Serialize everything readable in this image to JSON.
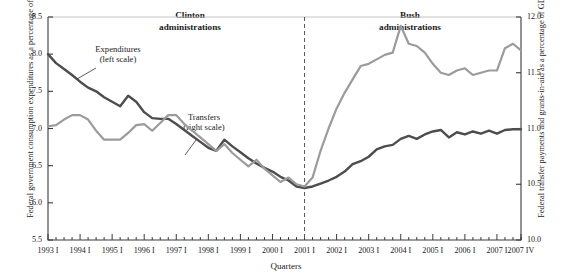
{
  "axes": {
    "ylabel_left": "Federal government consumption expenditures as a percentage of GDP",
    "ylabel_right": "Federal transfer payments and grants-in-aid as a percentage of GDP",
    "xlabel": "Quarters",
    "yticks_left": [
      "5.5",
      "6.0",
      "6.5",
      "7.0",
      "7.5",
      "8.0",
      "8.5"
    ],
    "yticks_right": [
      "10.0",
      "10.5",
      "11.0",
      "11.5",
      "12.0"
    ],
    "xticks": [
      "1993 I",
      "1994 I",
      "1995 I",
      "1996 I",
      "1997 I",
      "1998 I",
      "1999 I",
      "2000 I",
      "2001 I",
      "2002 I",
      "2003 I",
      "2004 I",
      "2005 I",
      "2006 I",
      "2007 I",
      "2007 IV"
    ]
  },
  "annotations": {
    "era_clinton": "Clinton\nadministrations",
    "era_clinton_line1": "Clinton",
    "era_clinton_line2": "administrations",
    "era_bush_line1": "Bush",
    "era_bush_line2": "administrations",
    "callout_expenditures_line1": "Expenditures",
    "callout_expenditures_line2": "(left scale)",
    "callout_transfers_line1": "Transfers",
    "callout_transfers_line2": "(right scale)",
    "divider_label": "2001 I"
  },
  "colors": {
    "expenditures": "#4d4d4d",
    "transfers": "#9b9b9b",
    "axis": "#3a3a3a",
    "background": "#ffffff"
  },
  "chart_data": {
    "type": "line",
    "title": "",
    "xlabel": "Quarters",
    "ylabel": "Federal government consumption expenditures as a percentage of GDP",
    "ylabel_right": "Federal transfer payments and grants-in-aid as a percentage of GDP",
    "ylim": [
      5.5,
      8.5
    ],
    "ylim_right": [
      10.0,
      12.0
    ],
    "grid": false,
    "legend": "inline-callouts",
    "x": [
      "1993 I",
      "1993 II",
      "1993 III",
      "1993 IV",
      "1994 I",
      "1994 II",
      "1994 III",
      "1994 IV",
      "1995 I",
      "1995 II",
      "1995 III",
      "1995 IV",
      "1996 I",
      "1996 II",
      "1996 III",
      "1996 IV",
      "1997 I",
      "1997 II",
      "1997 III",
      "1997 IV",
      "1998 I",
      "1998 II",
      "1998 III",
      "1998 IV",
      "1999 I",
      "1999 II",
      "1999 III",
      "1999 IV",
      "2000 I",
      "2000 II",
      "2000 III",
      "2000 IV",
      "2001 I",
      "2001 II",
      "2001 III",
      "2001 IV",
      "2002 I",
      "2002 II",
      "2002 III",
      "2002 IV",
      "2003 I",
      "2003 II",
      "2003 III",
      "2003 IV",
      "2004 I",
      "2004 II",
      "2004 III",
      "2004 IV",
      "2005 I",
      "2005 II",
      "2005 III",
      "2005 IV",
      "2006 I",
      "2006 II",
      "2006 III",
      "2006 IV",
      "2007 I",
      "2007 II",
      "2007 III",
      "2007 IV"
    ],
    "series": [
      {
        "name": "Expenditures (left scale)",
        "axis": "left",
        "color": "#4d4d4d",
        "values": [
          8.0,
          7.88,
          7.8,
          7.72,
          7.63,
          7.55,
          7.5,
          7.42,
          7.36,
          7.3,
          7.44,
          7.36,
          7.22,
          7.14,
          7.13,
          7.13,
          7.06,
          6.98,
          6.9,
          6.82,
          6.74,
          6.7,
          6.85,
          6.76,
          6.68,
          6.6,
          6.53,
          6.47,
          6.42,
          6.35,
          6.3,
          6.22,
          6.2,
          6.22,
          6.26,
          6.3,
          6.35,
          6.42,
          6.52,
          6.56,
          6.62,
          6.72,
          6.76,
          6.78,
          6.86,
          6.9,
          6.86,
          6.92,
          6.96,
          6.98,
          6.88,
          6.95,
          6.92,
          6.96,
          6.93,
          6.97,
          6.93,
          6.98,
          6.99,
          6.99
        ]
      },
      {
        "name": "Transfers (right scale)",
        "axis": "right",
        "color": "#9b9b9b",
        "values": [
          11.02,
          11.03,
          11.08,
          11.12,
          11.12,
          11.08,
          10.98,
          10.9,
          10.9,
          10.9,
          10.96,
          11.03,
          11.04,
          10.98,
          11.05,
          11.12,
          11.12,
          11.04,
          10.98,
          10.92,
          10.86,
          10.8,
          10.86,
          10.78,
          10.72,
          10.66,
          10.72,
          10.64,
          10.58,
          10.52,
          10.56,
          10.5,
          10.48,
          10.56,
          10.8,
          11.0,
          11.18,
          11.32,
          11.44,
          11.56,
          11.58,
          11.62,
          11.66,
          11.68,
          11.92,
          11.76,
          11.74,
          11.68,
          11.58,
          11.5,
          11.48,
          11.52,
          11.54,
          11.48,
          11.5,
          11.52,
          11.52,
          11.72,
          11.76,
          11.7
        ]
      }
    ],
    "annotations": [
      {
        "text": "Clinton administrations",
        "type": "era-label"
      },
      {
        "text": "Bush administrations",
        "type": "era-label"
      },
      {
        "text": "2001 I",
        "type": "vertical-divider-dashed"
      }
    ]
  }
}
